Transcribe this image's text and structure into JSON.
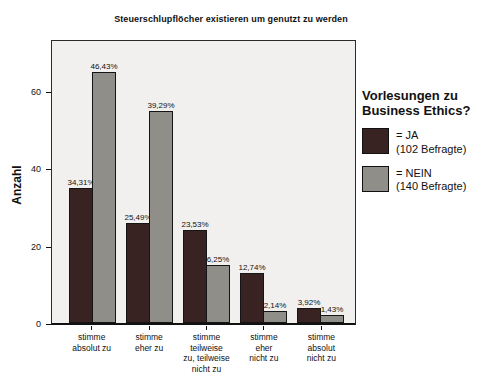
{
  "page": {
    "background": "#ffffff"
  },
  "chart_data": {
    "type": "bar",
    "title": "Steuerschlupflöcher existieren um genutzt zu werden",
    "ylabel": "Anzahl",
    "xlabel": "",
    "ylim": [
      0,
      73
    ],
    "yticks": [
      0,
      20,
      40,
      60
    ],
    "grid": false,
    "legend_position": "right",
    "legend_title": "Vorlesungen zu Business Ethics?",
    "plot_background": "#f1f0ee",
    "axis_color": "#111111",
    "categories": [
      "stimme\nabsolut zu",
      "stimme\neher zu",
      "stimme teilweise\nzu, teilweise\nnicht zu",
      "stimme\neher\nnicht zu",
      "stimme\nabsolut\nnicht zu"
    ],
    "series": [
      {
        "name": "JA",
        "legend_label": "= JA\n(102 Befragte)",
        "color": "#392322",
        "values": [
          35,
          26,
          24,
          13,
          4
        ],
        "bar_labels": [
          "34,31%",
          "25,49%",
          "23,53%",
          "12,74%",
          "3,92%"
        ]
      },
      {
        "name": "NEIN",
        "legend_label": "= NEIN\n(140 Befragte)",
        "color": "#8f8e88",
        "values": [
          65,
          55,
          15,
          3,
          2
        ],
        "bar_labels": [
          "46,43%",
          "39,29%",
          "6,25%",
          "2,14%",
          "1,43%"
        ]
      }
    ]
  }
}
